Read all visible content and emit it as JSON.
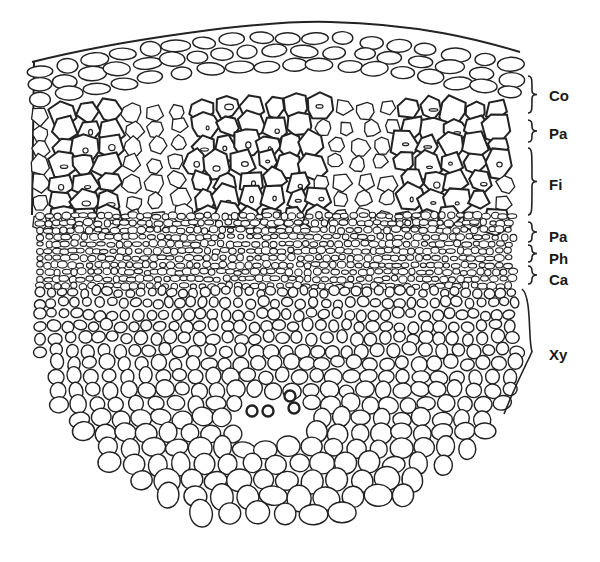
{
  "figure": {
    "type": "plant stem transverse section (line drawing)",
    "stroke_color": "#222222",
    "background": "#ffffff"
  },
  "labels": [
    {
      "id": "co",
      "text": "Co",
      "meaning": "cortex",
      "x": 549,
      "y": 88,
      "bracket": {
        "x": 532,
        "y1": 76,
        "y2": 113,
        "type": "curly"
      }
    },
    {
      "id": "pa1",
      "text": "Pa",
      "meaning": "parenchyma",
      "x": 549,
      "y": 126,
      "bracket": {
        "x": 532,
        "y1": 120,
        "y2": 142,
        "type": "curly"
      }
    },
    {
      "id": "fi",
      "text": "Fi",
      "meaning": "fibres",
      "x": 549,
      "y": 177,
      "bracket": {
        "x": 532,
        "y1": 148,
        "y2": 215,
        "type": "curly"
      }
    },
    {
      "id": "pa2",
      "text": "Pa",
      "meaning": "parenchyma",
      "x": 549,
      "y": 229,
      "bracket": {
        "x": 532,
        "y1": 222,
        "y2": 242,
        "type": "curly"
      }
    },
    {
      "id": "ph",
      "text": "Ph",
      "meaning": "phloem",
      "x": 549,
      "y": 251,
      "bracket": {
        "x": 532,
        "y1": 245,
        "y2": 262,
        "type": "curly"
      }
    },
    {
      "id": "ca",
      "text": "Ca",
      "meaning": "cambium",
      "x": 549,
      "y": 272,
      "bracket": {
        "x": 532,
        "y1": 266,
        "y2": 284,
        "type": "curly"
      }
    },
    {
      "id": "xy",
      "text": "Xy",
      "meaning": "xylem",
      "x": 549,
      "y": 347,
      "bracket": {
        "x": 532,
        "y1": 289,
        "y2": 414,
        "type": "long"
      }
    }
  ]
}
